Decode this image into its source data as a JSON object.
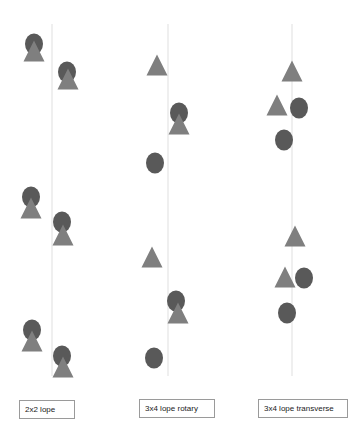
{
  "colors": {
    "circle": "#595959",
    "triangle": "#7f7f7f",
    "line": "#e4e4e4",
    "label_border": "#9a9a9a"
  },
  "columns": [
    {
      "label": "2x2 lope",
      "line_x": 52,
      "marks": [
        {
          "type": "circle",
          "x": 34,
          "y": 44
        },
        {
          "type": "triangle",
          "x": 34,
          "y": 51
        },
        {
          "type": "circle",
          "x": 67,
          "y": 72
        },
        {
          "type": "triangle",
          "x": 68,
          "y": 79
        },
        {
          "type": "circle",
          "x": 31,
          "y": 197
        },
        {
          "type": "triangle",
          "x": 31,
          "y": 208
        },
        {
          "type": "circle",
          "x": 62,
          "y": 222
        },
        {
          "type": "triangle",
          "x": 63,
          "y": 235
        },
        {
          "type": "circle",
          "x": 32,
          "y": 330
        },
        {
          "type": "triangle",
          "x": 32,
          "y": 341
        },
        {
          "type": "circle",
          "x": 62,
          "y": 356
        },
        {
          "type": "triangle",
          "x": 63,
          "y": 367
        }
      ]
    },
    {
      "label": "3x4 lope rotary",
      "line_x": 168,
      "marks": [
        {
          "type": "triangle",
          "x": 157,
          "y": 65
        },
        {
          "type": "circle",
          "x": 179,
          "y": 113
        },
        {
          "type": "triangle",
          "x": 179,
          "y": 124
        },
        {
          "type": "circle",
          "x": 155,
          "y": 163
        },
        {
          "type": "triangle",
          "x": 152,
          "y": 257
        },
        {
          "type": "circle",
          "x": 176,
          "y": 301
        },
        {
          "type": "triangle",
          "x": 178,
          "y": 313
        },
        {
          "type": "circle",
          "x": 154,
          "y": 358
        }
      ]
    },
    {
      "label": "3x4 lope transverse",
      "line_x": 292,
      "marks": [
        {
          "type": "triangle",
          "x": 292,
          "y": 71
        },
        {
          "type": "triangle",
          "x": 277,
          "y": 105
        },
        {
          "type": "circle",
          "x": 299,
          "y": 108
        },
        {
          "type": "circle",
          "x": 284,
          "y": 140
        },
        {
          "type": "triangle",
          "x": 295,
          "y": 236
        },
        {
          "type": "triangle",
          "x": 285,
          "y": 277
        },
        {
          "type": "circle",
          "x": 304,
          "y": 278
        },
        {
          "type": "circle",
          "x": 287,
          "y": 313
        }
      ]
    }
  ],
  "labels": {
    "col1": "2x2 lope",
    "col2": "3x4 lope rotary",
    "col3": "3x4 lope transverse"
  }
}
